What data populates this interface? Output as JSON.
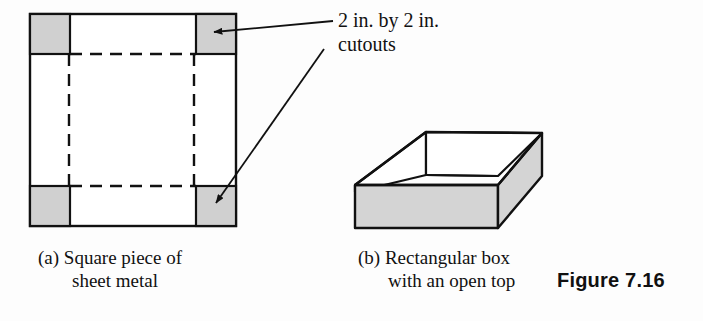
{
  "figure": {
    "number_label": "Figure 7.16",
    "background_color": "#fdfdfd",
    "ink_color": "#111111",
    "cutout_fill_color": "#d0d0d0",
    "box_face_fill_color": "#d4d4d4"
  },
  "callout": {
    "line1": "2 in. by 2 in.",
    "line2": "cutouts",
    "arrow_count": 2
  },
  "panel_a": {
    "caption_line1": "(a) Square piece of",
    "caption_line2": "sheet metal",
    "shape": "square-sheet-with-corner-cutouts",
    "cutout_count": 4,
    "fold_lines": "dashed"
  },
  "panel_b": {
    "caption_line1": "(b) Rectangular box",
    "caption_line2": "with an open top",
    "shape": "open-top-rectangular-box"
  }
}
